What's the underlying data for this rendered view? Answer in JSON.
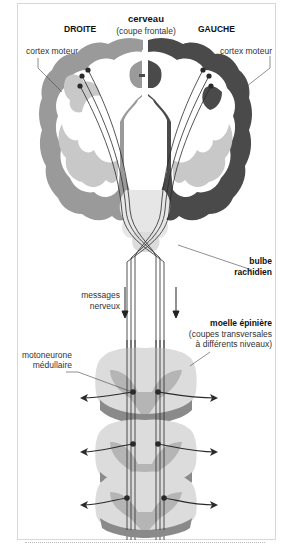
{
  "diagram": {
    "title": "cerveau",
    "subtitle": "(coupe frontale)",
    "side_right_label": "DROITE",
    "side_left_label": "GAUCHE",
    "labels": {
      "cortex_left": "cortex moteur",
      "cortex_right": "cortex moteur",
      "bulbe_line1": "bulbe",
      "bulbe_line2": "rachidien",
      "messages_line1": "messages",
      "messages_line2": "nerveux",
      "moelle_title": "moelle épinière",
      "moelle_sub1": "(coupes transversales",
      "moelle_sub2": "à différents niveaux)",
      "motoneurone_line1": "motoneurone",
      "motoneurone_line2": "médullaire"
    },
    "colors": {
      "right_hemisphere_gray": "#9a9a9a",
      "left_hemisphere_dark": "#4a4a4a",
      "white_matter": "#ffffff",
      "inner_gray": "#c8c8c8",
      "spinal_light": "#dcdcdc",
      "spinal_mid": "#b5b5b5",
      "spinal_dark": "#8a8a8a",
      "fiber_stroke": "#2a2a2a",
      "frame_border": "#d8d8d8"
    },
    "spinal_sections_count": 3
  }
}
